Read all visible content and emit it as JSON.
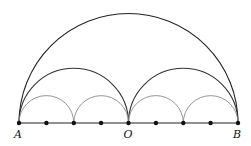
{
  "diagram": {
    "title": "",
    "baseline": {
      "x1": 19,
      "x2": 238,
      "y": 123
    },
    "points": [
      {
        "label": "A",
        "x": 19
      },
      {
        "label": "",
        "x": 46.4
      },
      {
        "label": "",
        "x": 73.8
      },
      {
        "label": "",
        "x": 101.1
      },
      {
        "label": "O",
        "x": 128.5
      },
      {
        "label": "",
        "x": 155.9
      },
      {
        "label": "",
        "x": 183.3
      },
      {
        "label": "",
        "x": 210.6
      },
      {
        "label": "B",
        "x": 238
      }
    ],
    "labels": {
      "A": "A",
      "O": "O",
      "B": "B"
    },
    "arcs": {
      "large": [
        {
          "from": 19,
          "to": 238
        }
      ],
      "medium": [
        {
          "from": 19,
          "to": 128.5
        },
        {
          "from": 128.5,
          "to": 238
        }
      ],
      "small": [
        {
          "from": 19,
          "to": 73.8
        },
        {
          "from": 73.8,
          "to": 128.5
        },
        {
          "from": 128.5,
          "to": 183.3
        },
        {
          "from": 183.3,
          "to": 238
        }
      ]
    },
    "colors": {
      "large": "#222222",
      "medium": "#333333",
      "small": "#8a8a8a",
      "baseline": "#222222",
      "points": "#111111"
    }
  }
}
